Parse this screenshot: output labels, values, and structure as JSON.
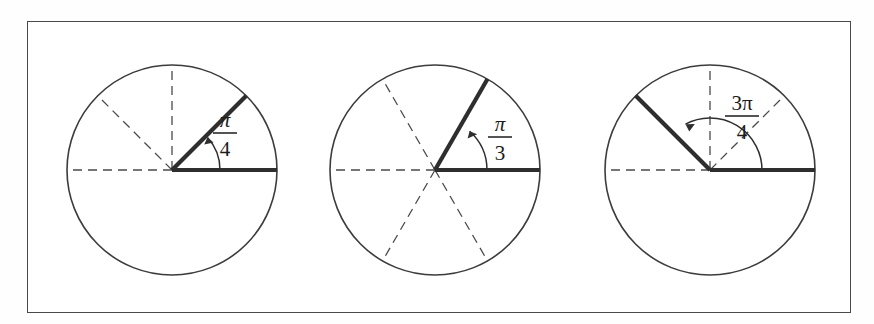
{
  "figure": {
    "background_color": "#fefefe",
    "frame_color": "#4a4a4a",
    "stroke_color": "#2e2e2e",
    "dashed_color": "#4a4a4a",
    "panels": [
      {
        "id": "panel-pi-over-4",
        "angle_label": {
          "numerator": "π",
          "denominator": "4",
          "full": "π/4"
        },
        "center": {
          "x": 172,
          "y": 170
        },
        "radius": 105,
        "terminal_ray_degrees": 45,
        "initial_ray_degrees": 0,
        "dashed_ray_degrees": [
          90,
          135,
          180
        ],
        "arc_radius": 48,
        "label_position": {
          "x": 225,
          "y": 128
        }
      },
      {
        "id": "panel-pi-over-3",
        "angle_label": {
          "numerator": "π",
          "denominator": "3",
          "full": "π/3"
        },
        "center": {
          "x": 435,
          "y": 170
        },
        "radius": 105,
        "terminal_ray_degrees": 60,
        "initial_ray_degrees": 0,
        "dashed_ray_degrees": [
          120,
          180,
          240,
          300
        ],
        "arc_radius": 52,
        "label_position": {
          "x": 500,
          "y": 132
        }
      },
      {
        "id": "panel-3pi-over-4",
        "angle_label": {
          "numerator": "3π",
          "denominator": "4",
          "full": "3π/4"
        },
        "center": {
          "x": 710,
          "y": 170
        },
        "radius": 105,
        "terminal_ray_degrees": 135,
        "initial_ray_degrees": 0,
        "dashed_ray_degrees": [
          45,
          90,
          180
        ],
        "arc_radius": 52,
        "label_position": {
          "x": 742,
          "y": 110
        }
      }
    ]
  }
}
